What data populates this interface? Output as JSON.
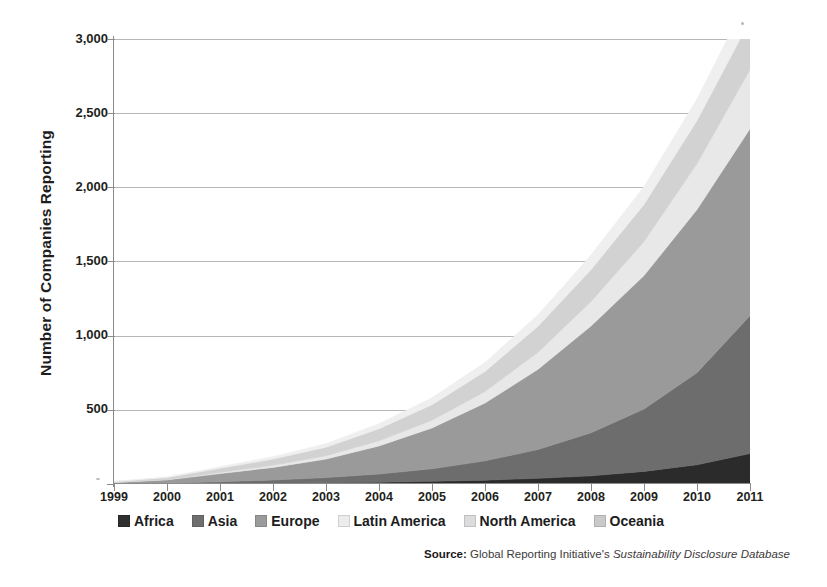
{
  "chart_data": {
    "type": "area",
    "stacked": true,
    "title": "",
    "xlabel": "",
    "ylabel": "Number of Companies Reporting",
    "x": [
      1999,
      2000,
      2001,
      2002,
      2003,
      2004,
      2005,
      2006,
      2007,
      2008,
      2009,
      2010,
      2011
    ],
    "xticklabels": [
      "1999",
      "2000",
      "2001",
      "2002",
      "2003",
      "2004",
      "2005",
      "2006",
      "2007",
      "2008",
      "2009",
      "2010",
      "2011"
    ],
    "ylim": [
      0,
      3000
    ],
    "yticks": [
      0,
      500,
      1000,
      1500,
      2000,
      2500,
      3000
    ],
    "yticklabels": [
      "",
      "500",
      "1,000",
      "1,500",
      "2,000",
      "2,500",
      "3,000"
    ],
    "grid": "horizontal",
    "legend_position": "below-axis",
    "series": [
      {
        "name": "Africa",
        "color": "#2b2b2b",
        "values": [
          0,
          1,
          3,
          5,
          8,
          12,
          18,
          26,
          38,
          55,
          85,
          130,
          205
        ]
      },
      {
        "name": "Asia",
        "color": "#6d6d6d",
        "values": [
          2,
          5,
          12,
          22,
          35,
          55,
          85,
          130,
          195,
          290,
          420,
          620,
          930
        ]
      },
      {
        "name": "Europe",
        "color": "#9a9a9a",
        "values": [
          8,
          22,
          55,
          85,
          125,
          190,
          275,
          390,
          540,
          720,
          900,
          1100,
          1260
        ]
      },
      {
        "name": "Latin America",
        "color": "#e8e8e8",
        "values": [
          1,
          3,
          8,
          14,
          22,
          35,
          52,
          78,
          115,
          165,
          230,
          310,
          400
        ]
      },
      {
        "name": "North America",
        "color": "#d2d2d2",
        "values": [
          5,
          12,
          28,
          42,
          58,
          80,
          105,
          135,
          175,
          215,
          250,
          290,
          330
        ]
      },
      {
        "name": "Oceania",
        "color": "#efefef",
        "values": [
          2,
          5,
          10,
          16,
          24,
          34,
          46,
          60,
          78,
          98,
          120,
          145,
          175
        ]
      }
    ],
    "totals": [
      18,
      48,
      116,
      184,
      272,
      406,
      581,
      819,
      1141,
      1543,
      2005,
      2595,
      3300
    ],
    "annotations": []
  },
  "axes": {
    "y_title": "Number of Companies Reporting",
    "y_tick_labels": [
      "3,000",
      "2,500",
      "2,000",
      "1,500",
      "1,000",
      "500"
    ],
    "x_tick_labels": [
      "1999",
      "2000",
      "2001",
      "2002",
      "2003",
      "2004",
      "2005",
      "2006",
      "2007",
      "2008",
      "2009",
      "2010",
      "2011"
    ]
  },
  "legend": {
    "items": [
      {
        "label": "Africa",
        "color": "#2f2f2f"
      },
      {
        "label": "Asia",
        "color": "#6e6e6e"
      },
      {
        "label": "Europe",
        "color": "#9b9b9b"
      },
      {
        "label": "Latin America",
        "color": "#ececec"
      },
      {
        "label": "North America",
        "color": "#dcdcdc"
      },
      {
        "label": "Oceania",
        "color": "#c9c9c9"
      }
    ]
  },
  "source": {
    "label": "Source:",
    "body": "Global Reporting Initiative's",
    "italic": "Sustainability Disclosure Database"
  }
}
